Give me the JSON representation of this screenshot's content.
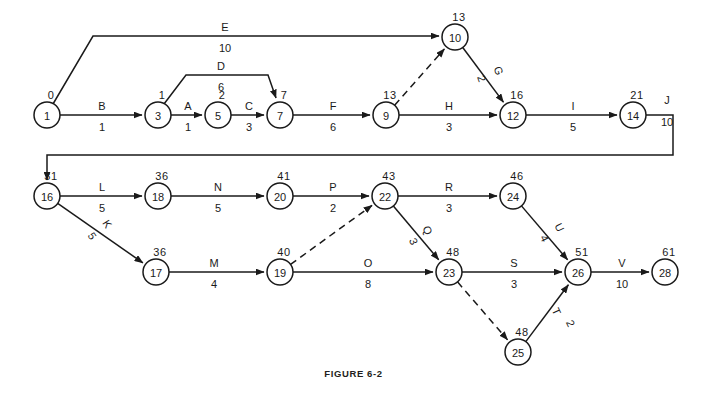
{
  "figure": {
    "caption": "FIGURE 6-2",
    "colors": {
      "ink": "#1a1a1a",
      "background": "#ffffff",
      "caption": "#231f20"
    }
  },
  "chart_data": {
    "type": "diagram",
    "subtype": "activity-on-arrow-network",
    "title": "FIGURE 6-2",
    "xlabel": "",
    "ylabel": "",
    "grid": false,
    "legend": "none",
    "node_label_meaning": "event number inside circle, earliest event time above circle",
    "edge_label_meaning": "activity letter above arrow, duration below arrow",
    "nodes": [
      {
        "id": "1",
        "value": "0",
        "x": 47,
        "y": 115
      },
      {
        "id": "3",
        "value": "1",
        "x": 158,
        "y": 115
      },
      {
        "id": "5",
        "value": "2",
        "x": 218,
        "y": 115
      },
      {
        "id": "7",
        "value": "7",
        "x": 280,
        "y": 115
      },
      {
        "id": "9",
        "value": "13",
        "x": 386,
        "y": 115
      },
      {
        "id": "10",
        "value": "13",
        "x": 455,
        "y": 37
      },
      {
        "id": "12",
        "value": "16",
        "x": 513,
        "y": 115
      },
      {
        "id": "14",
        "value": "21",
        "x": 633,
        "y": 115
      },
      {
        "id": "16",
        "value": "31",
        "x": 47,
        "y": 196
      },
      {
        "id": "18",
        "value": "36",
        "x": 158,
        "y": 196
      },
      {
        "id": "20",
        "value": "41",
        "x": 280,
        "y": 196
      },
      {
        "id": "22",
        "value": "43",
        "x": 385,
        "y": 196
      },
      {
        "id": "24",
        "value": "46",
        "x": 513,
        "y": 196
      },
      {
        "id": "17",
        "value": "36",
        "x": 156,
        "y": 272
      },
      {
        "id": "19",
        "value": "40",
        "x": 280,
        "y": 272
      },
      {
        "id": "23",
        "value": "48",
        "x": 449,
        "y": 272
      },
      {
        "id": "25",
        "value": "48",
        "x": 518,
        "y": 352
      },
      {
        "id": "26",
        "value": "51",
        "x": 578,
        "y": 272
      },
      {
        "id": "28",
        "value": "61",
        "x": 665,
        "y": 272
      }
    ],
    "edges": [
      {
        "name": "E",
        "duration": "10",
        "from": "1",
        "to": "10",
        "style": "solid",
        "label_x": 225,
        "label_y": 31,
        "dur_x": 225,
        "dur_y": 52,
        "rotate": 0
      },
      {
        "name": "B",
        "duration": "1",
        "from": "1",
        "to": "3",
        "style": "solid",
        "label_x": 102,
        "label_y": 110,
        "dur_x": 102,
        "dur_y": 131,
        "rotate": 0
      },
      {
        "name": "D",
        "duration": "6",
        "from": "3",
        "to": "7",
        "style": "solid",
        "label_x": 221,
        "label_y": 70,
        "dur_x": 221,
        "dur_y": 91,
        "rotate": 0
      },
      {
        "name": "A",
        "duration": "1",
        "from": "3",
        "to": "5",
        "style": "solid",
        "label_x": 188,
        "label_y": 110,
        "dur_x": 188,
        "dur_y": 131,
        "rotate": 0
      },
      {
        "name": "C",
        "duration": "3",
        "from": "5",
        "to": "7",
        "style": "solid",
        "label_x": 249,
        "label_y": 110,
        "dur_x": 249,
        "dur_y": 131,
        "rotate": 0
      },
      {
        "name": "F",
        "duration": "6",
        "from": "7",
        "to": "9",
        "style": "solid",
        "label_x": 333,
        "label_y": 110,
        "dur_x": 333,
        "dur_y": 131,
        "rotate": 0
      },
      {
        "name": "",
        "duration": "",
        "from": "9",
        "to": "10",
        "style": "dashed",
        "label_x": 0,
        "label_y": 0,
        "dur_x": 0,
        "dur_y": 0,
        "rotate": 0
      },
      {
        "name": "G",
        "duration": "2",
        "from": "10",
        "to": "12",
        "style": "solid",
        "label_x": 495,
        "label_y": 72,
        "dur_x": 478,
        "dur_y": 80,
        "rotate": 70
      },
      {
        "name": "H",
        "duration": "3",
        "from": "9",
        "to": "12",
        "style": "solid",
        "label_x": 449,
        "label_y": 110,
        "dur_x": 449,
        "dur_y": 131,
        "rotate": 0
      },
      {
        "name": "I",
        "duration": "5",
        "from": "12",
        "to": "14",
        "style": "solid",
        "label_x": 573,
        "label_y": 110,
        "dur_x": 573,
        "dur_y": 131,
        "rotate": 0
      },
      {
        "name": "J",
        "duration": "10",
        "from": "14",
        "to": "16",
        "style": "solid",
        "label_x": 667,
        "label_y": 104,
        "dur_x": 667,
        "dur_y": 126,
        "rotate": 0
      },
      {
        "name": "L",
        "duration": "5",
        "from": "16",
        "to": "18",
        "style": "solid",
        "label_x": 102,
        "label_y": 191,
        "dur_x": 102,
        "dur_y": 212,
        "rotate": 0
      },
      {
        "name": "N",
        "duration": "5",
        "from": "18",
        "to": "20",
        "style": "solid",
        "label_x": 218,
        "label_y": 191,
        "dur_x": 218,
        "dur_y": 212,
        "rotate": 0
      },
      {
        "name": "P",
        "duration": "2",
        "from": "20",
        "to": "22",
        "style": "solid",
        "label_x": 333,
        "label_y": 191,
        "dur_x": 333,
        "dur_y": 212,
        "rotate": 0
      },
      {
        "name": "R",
        "duration": "3",
        "from": "22",
        "to": "24",
        "style": "solid",
        "label_x": 449,
        "label_y": 191,
        "dur_x": 449,
        "dur_y": 212,
        "rotate": 0
      },
      {
        "name": "K",
        "duration": "5",
        "from": "16",
        "to": "17",
        "style": "solid",
        "label_x": 104,
        "label_y": 226,
        "dur_x": 89,
        "dur_y": 238,
        "rotate": 57
      },
      {
        "name": "M",
        "duration": "4",
        "from": "17",
        "to": "19",
        "style": "solid",
        "label_x": 214,
        "label_y": 267,
        "dur_x": 214,
        "dur_y": 288,
        "rotate": 0
      },
      {
        "name": "",
        "duration": "",
        "from": "19",
        "to": "22",
        "style": "dashed",
        "label_x": 0,
        "label_y": 0,
        "dur_x": 0,
        "dur_y": 0,
        "rotate": 0
      },
      {
        "name": "O",
        "duration": "8",
        "from": "19",
        "to": "23",
        "style": "solid",
        "label_x": 368,
        "label_y": 267,
        "dur_x": 368,
        "dur_y": 288,
        "rotate": 0
      },
      {
        "name": "Q",
        "duration": "3",
        "from": "22",
        "to": "23",
        "style": "solid",
        "label_x": 424,
        "label_y": 232,
        "dur_x": 410,
        "dur_y": 243,
        "rotate": 65
      },
      {
        "name": "S",
        "duration": "3",
        "from": "23",
        "to": "26",
        "style": "solid",
        "label_x": 514,
        "label_y": 267,
        "dur_x": 514,
        "dur_y": 288,
        "rotate": 0
      },
      {
        "name": "U",
        "duration": "4",
        "from": "24",
        "to": "26",
        "style": "solid",
        "label_x": 556,
        "label_y": 229,
        "dur_x": 541,
        "dur_y": 240,
        "rotate": 64
      },
      {
        "name": "",
        "duration": "",
        "from": "23",
        "to": "25",
        "style": "dashed",
        "label_x": 0,
        "label_y": 0,
        "dur_x": 0,
        "dur_y": 0,
        "rotate": 0
      },
      {
        "name": "T",
        "duration": "2",
        "from": "25",
        "to": "26",
        "style": "solid",
        "label_x": 553,
        "label_y": 313,
        "dur_x": 567,
        "dur_y": 325,
        "rotate": 65
      },
      {
        "name": "V",
        "duration": "10",
        "from": "26",
        "to": "28",
        "style": "solid",
        "label_x": 622,
        "label_y": 267,
        "dur_x": 622,
        "dur_y": 288,
        "rotate": 0
      }
    ]
  }
}
